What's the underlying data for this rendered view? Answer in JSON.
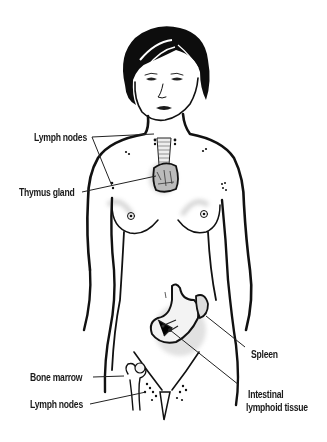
{
  "figure": {
    "style": "black-and-white line illustration of female figure",
    "labels": {
      "lymph_nodes_upper": "Lymph nodes",
      "thymus_gland": "Thymus gland",
      "spleen": "Spleen",
      "bone_marrow": "Bone marrow",
      "lymph_nodes_lower": "Lymph nodes",
      "intestinal_line1": "Intestinal",
      "intestinal_line2": "lymphoid tissue"
    }
  },
  "colors": {
    "ink": "#111111",
    "background": "#ffffff",
    "shading": "#d8d8d8"
  }
}
